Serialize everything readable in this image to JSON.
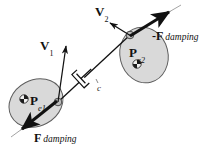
{
  "figure": {
    "caption_present": false,
    "background_color": "#ffffff",
    "ink_color": "#111111",
    "blob_fill_color": "#d8d8d8",
    "blob_stroke_color": "#5a5a5a",
    "node_fill_color": "#b8b8b8"
  },
  "labels": {
    "velocity_1": {
      "symbol": "V",
      "subscript": "1"
    },
    "velocity_2": {
      "symbol": "V",
      "subscript": "2"
    },
    "force_damping": {
      "symbol": "F",
      "subscript": "damping",
      "prefix": ""
    },
    "force_damping_reaction": {
      "symbol": "F",
      "subscript": "damping",
      "prefix": "-"
    },
    "body_1": {
      "symbol": "P",
      "subscript": "e1"
    },
    "body_2": {
      "symbol": "P",
      "subscript": "e2"
    },
    "damper_coefficient": {
      "symbol": "c"
    }
  },
  "geometry": {
    "body_1": {
      "cx": 36,
      "cy": 103,
      "rx": 28,
      "ry": 23,
      "rotation": -28
    },
    "body_2": {
      "cx": 144,
      "cy": 55,
      "rx": 24,
      "ry": 28,
      "rotation": -18
    },
    "marker_1": {
      "cx": 24,
      "cy": 99,
      "r": 4
    },
    "marker_2": {
      "cx": 137,
      "cy": 63,
      "r": 4
    },
    "node_1": {
      "cx": 58,
      "cy": 102,
      "r": 3.6
    },
    "node_2": {
      "cx": 130,
      "cy": 35,
      "r": 3.6
    },
    "connector": {
      "x1": 58,
      "y1": 102,
      "x2": 130,
      "y2": 35
    },
    "damper_center": {
      "cx": 89,
      "cy": 71
    },
    "arrow_v1": {
      "x1": 58,
      "y1": 102,
      "x2": 66,
      "y2": 45
    },
    "arrow_v2": {
      "x1": 131,
      "y1": 36,
      "x2": 110,
      "y2": 23
    },
    "arrow_f_damping": {
      "x1": 56,
      "y1": 100,
      "x2": 20,
      "y2": 130
    },
    "arrow_f_damping_reaction": {
      "x1": 130,
      "y1": 36,
      "x2": 171,
      "y2": 10
    }
  }
}
